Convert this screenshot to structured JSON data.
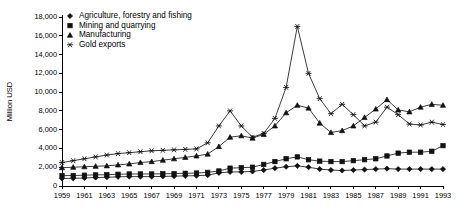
{
  "chart_data": {
    "type": "line",
    "title": "",
    "xlabel": "",
    "ylabel": "Million USD",
    "ylim": [
      0,
      18000
    ],
    "ytick_step": 2000,
    "ytick_labels": [
      "0",
      "2,000",
      "4,000",
      "6,000",
      "8,000",
      "10,000",
      "12,000",
      "14,000",
      "16,000",
      "18,000"
    ],
    "grid": false,
    "legend_position": "top-left-inside",
    "x": [
      1959,
      1960,
      1961,
      1962,
      1963,
      1964,
      1965,
      1966,
      1967,
      1968,
      1969,
      1970,
      1971,
      1972,
      1973,
      1974,
      1975,
      1976,
      1977,
      1978,
      1979,
      1980,
      1981,
      1982,
      1983,
      1984,
      1985,
      1986,
      1987,
      1988,
      1989,
      1990,
      1991,
      1992,
      1993
    ],
    "xtick_labels": [
      "1959",
      "1961",
      "1963",
      "1965",
      "1967",
      "1969",
      "1971",
      "1973",
      "1975",
      "1977",
      "1979",
      "1981",
      "1983",
      "1985",
      "1987",
      "1989",
      "1991",
      "1993"
    ],
    "xtick_values": [
      1959,
      1961,
      1963,
      1965,
      1967,
      1969,
      1971,
      1973,
      1975,
      1977,
      1979,
      1981,
      1983,
      1985,
      1987,
      1989,
      1991,
      1993
    ],
    "series": [
      {
        "name": "Agriculture, forestry and fishing",
        "marker": "diamond",
        "values": [
          800,
          820,
          850,
          900,
          930,
          980,
          1000,
          1000,
          1000,
          1020,
          1050,
          1080,
          1100,
          1150,
          1400,
          1500,
          1500,
          1550,
          1700,
          1900,
          2050,
          2150,
          2000,
          1800,
          1700,
          1650,
          1700,
          1750,
          1800,
          1850,
          1800,
          1800,
          1800,
          1800,
          1800
        ]
      },
      {
        "name": "Mining and quarrying",
        "marker": "square",
        "values": [
          1100,
          1120,
          1150,
          1180,
          1200,
          1250,
          1280,
          1280,
          1280,
          1300,
          1320,
          1350,
          1380,
          1450,
          1600,
          1900,
          1950,
          2000,
          2300,
          2600,
          2900,
          3100,
          2800,
          2650,
          2600,
          2600,
          2700,
          2800,
          2900,
          3200,
          3500,
          3600,
          3600,
          3700,
          4300
        ]
      },
      {
        "name": "Manufacturing",
        "marker": "triangle",
        "values": [
          1950,
          2000,
          2050,
          2100,
          2150,
          2250,
          2350,
          2500,
          2600,
          2750,
          2900,
          3050,
          3200,
          3400,
          4200,
          5200,
          5350,
          5100,
          5500,
          6400,
          7800,
          8600,
          8300,
          6700,
          5700,
          5900,
          6400,
          7300,
          8200,
          9200,
          8100,
          7900,
          8400,
          8700,
          8600
        ]
      },
      {
        "name": "Gold exports",
        "marker": "star",
        "values": [
          2500,
          2700,
          2900,
          3100,
          3300,
          3450,
          3550,
          3650,
          3750,
          3800,
          3850,
          3900,
          3950,
          4600,
          6400,
          8000,
          6400,
          5200,
          5600,
          7200,
          10500,
          17000,
          12000,
          9300,
          7700,
          8700,
          7600,
          6400,
          6800,
          8400,
          7600,
          6600,
          6500,
          6800,
          6550
        ]
      }
    ]
  },
  "legend": {
    "items": [
      {
        "label": "Agriculture, forestry and fishing",
        "marker": "diamond"
      },
      {
        "label": "Mining and quarrying",
        "marker": "square"
      },
      {
        "label": "Manufacturing",
        "marker": "triangle"
      },
      {
        "label": "Gold exports",
        "marker": "star"
      }
    ]
  }
}
